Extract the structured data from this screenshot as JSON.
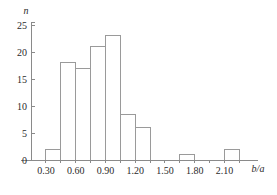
{
  "chart_data": {
    "type": "bar",
    "title": "",
    "subtitle": "",
    "xlabel": "b/a",
    "ylabel": "n",
    "xlim": [
      0.15,
      2.4
    ],
    "ylim": [
      0,
      25
    ],
    "grid": false,
    "legend": null,
    "bin_width": 0.15,
    "bin_edges": [
      0.3,
      0.45,
      0.6,
      0.75,
      0.9,
      1.05,
      1.2,
      1.35,
      1.65,
      1.8,
      2.1,
      2.25
    ],
    "categories": [
      "0.30-0.45",
      "0.45-0.60",
      "0.60-0.75",
      "0.75-0.90",
      "0.90-1.05",
      "1.05-1.20",
      "1.20-1.35",
      "1.65-1.80",
      "2.10-2.25"
    ],
    "values": [
      2,
      18,
      17,
      21,
      23,
      8.5,
      6,
      1,
      2
    ],
    "bars": [
      {
        "x0": 0.3,
        "x1": 0.45,
        "value": 2
      },
      {
        "x0": 0.45,
        "x1": 0.6,
        "value": 18
      },
      {
        "x0": 0.6,
        "x1": 0.75,
        "value": 17
      },
      {
        "x0": 0.75,
        "x1": 0.9,
        "value": 21
      },
      {
        "x0": 0.9,
        "x1": 1.05,
        "value": 23
      },
      {
        "x0": 1.05,
        "x1": 1.2,
        "value": 8.5
      },
      {
        "x0": 1.2,
        "x1": 1.35,
        "value": 6
      },
      {
        "x0": 1.65,
        "x1": 1.8,
        "value": 1
      },
      {
        "x0": 2.1,
        "x1": 2.25,
        "value": 2
      }
    ],
    "x_ticks": [
      0.3,
      0.45,
      0.6,
      0.75,
      0.9,
      1.05,
      1.2,
      1.35,
      1.5,
      1.65,
      1.8,
      1.95,
      2.1,
      2.25
    ],
    "x_tick_labels": [
      {
        "value": 0.3,
        "label": "0.30"
      },
      {
        "value": 0.6,
        "label": "0.60"
      },
      {
        "value": 0.9,
        "label": "0.90"
      },
      {
        "value": 1.2,
        "label": "1.20"
      },
      {
        "value": 1.5,
        "label": "1.50"
      },
      {
        "value": 1.8,
        "label": "1.80"
      },
      {
        "value": 2.1,
        "label": "2.10"
      }
    ],
    "y_ticks": [
      0,
      5,
      10,
      15,
      20,
      25
    ],
    "y_tick_labels": [
      "0",
      "5",
      "10",
      "15",
      "20",
      "25"
    ],
    "colors": {
      "bar_stroke": "#9a9a9a",
      "bar_fill": "none",
      "axis": "#8a8a8a",
      "text": "#2b2b2b",
      "background": "#ffffff"
    }
  }
}
